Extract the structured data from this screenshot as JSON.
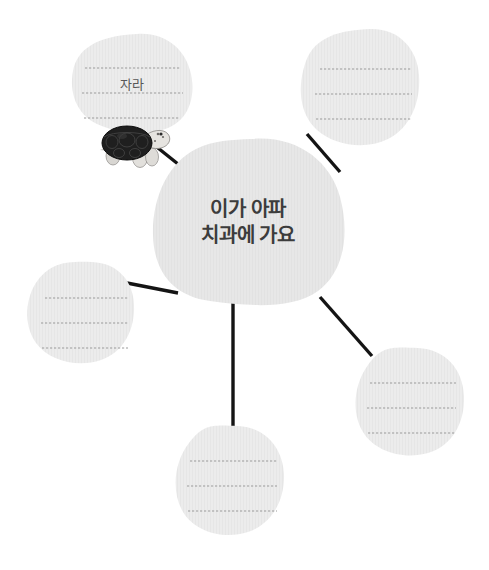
{
  "worksheet": {
    "type": "mind-map-worksheet",
    "page_background": "#ffffff",
    "bubble_fill": "#e7e7e7",
    "bubble_fill_light": "#ebebeb",
    "rule_line_color": "#9a9a9a",
    "connector_color": "#1a1a1a",
    "center_text_color": "#3c3c3c"
  },
  "center": {
    "name": "center-bubble",
    "text_line1": "이가 아파",
    "text_line2": "치과에 가요",
    "text": "이가 아파\n치과에 가요"
  },
  "branches": [
    {
      "id": "top-left",
      "name": "branch-bubble-top-left",
      "answer": "자라",
      "rule_lines": 3,
      "has_illustration": true,
      "illustration": "turtle-illustration"
    },
    {
      "id": "top-right",
      "name": "branch-bubble-top-right",
      "answer": "",
      "rule_lines": 3,
      "has_illustration": false
    },
    {
      "id": "left",
      "name": "branch-bubble-left",
      "answer": "",
      "rule_lines": 3,
      "has_illustration": false
    },
    {
      "id": "bottom-right",
      "name": "branch-bubble-bottom-right",
      "answer": "",
      "rule_lines": 3,
      "has_illustration": false
    },
    {
      "id": "bottom-center",
      "name": "branch-bubble-bottom-center",
      "answer": "",
      "rule_lines": 3,
      "has_illustration": false
    }
  ]
}
